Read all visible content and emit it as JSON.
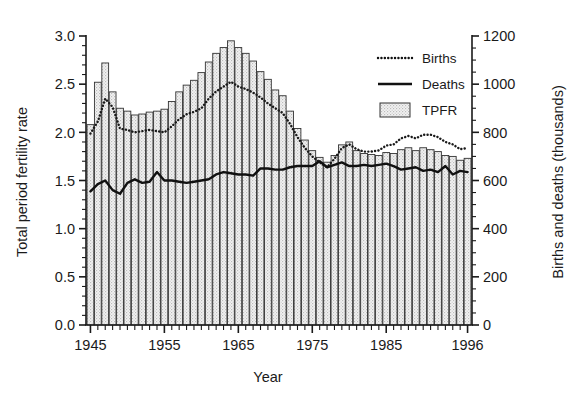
{
  "chart_data": {
    "type": "bar",
    "title": "",
    "subtitle": "",
    "xlabel": "Year",
    "ylabel": "Total period fertility rate",
    "y2label": "Births and deaths (thousands)",
    "xlim": [
      1944.4,
      1996.6
    ],
    "ylim": [
      0.0,
      3.0
    ],
    "y2lim": [
      0,
      1200
    ],
    "grid": false,
    "legend_position": "top-right",
    "x_ticks_major": [
      1945,
      1955,
      1965,
      1975,
      1985,
      1996
    ],
    "x_tick_labels": [
      "1945",
      "1955",
      "1965",
      "1975",
      "1985",
      "1996"
    ],
    "y_ticks_major": [
      0.0,
      0.5,
      1.0,
      1.5,
      2.0,
      2.5,
      3.0
    ],
    "y_tick_labels": [
      "0.0",
      "0.5",
      "1.0",
      "1.5",
      "2.0",
      "2.5",
      "3.0"
    ],
    "y2_ticks_major": [
      0,
      200,
      400,
      600,
      800,
      1000,
      1200
    ],
    "y2_tick_labels": [
      "0",
      "200",
      "400",
      "600",
      "800",
      "1000",
      "1200"
    ],
    "y_minor_step": 0.1,
    "y2_minor_step": 50,
    "x_minor_step": 1,
    "categories": [
      1945,
      1946,
      1947,
      1948,
      1949,
      1950,
      1951,
      1952,
      1953,
      1954,
      1955,
      1956,
      1957,
      1958,
      1959,
      1960,
      1961,
      1962,
      1963,
      1964,
      1965,
      1966,
      1967,
      1968,
      1969,
      1970,
      1971,
      1972,
      1973,
      1974,
      1975,
      1976,
      1977,
      1978,
      1979,
      1980,
      1981,
      1982,
      1983,
      1984,
      1985,
      1986,
      1987,
      1988,
      1989,
      1990,
      1991,
      1992,
      1993,
      1994,
      1995,
      1996
    ],
    "series": [
      {
        "name": "TPFR",
        "axis": "left",
        "style": "bar",
        "fill": "#e9e9e9",
        "edge": "#333333",
        "values": [
          2.08,
          2.52,
          2.72,
          2.42,
          2.25,
          2.22,
          2.18,
          2.19,
          2.21,
          2.22,
          2.24,
          2.32,
          2.42,
          2.49,
          2.54,
          2.62,
          2.73,
          2.82,
          2.88,
          2.95,
          2.88,
          2.82,
          2.74,
          2.63,
          2.55,
          2.44,
          2.38,
          2.22,
          2.04,
          1.92,
          1.81,
          1.74,
          1.69,
          1.76,
          1.87,
          1.9,
          1.81,
          1.78,
          1.77,
          1.76,
          1.79,
          1.78,
          1.82,
          1.84,
          1.81,
          1.84,
          1.82,
          1.8,
          1.76,
          1.75,
          1.71,
          1.73
        ]
      },
      {
        "name": "Births",
        "axis": "right",
        "style": "dotted-line",
        "color": "#1a1a1a",
        "values": [
          795,
          845,
          940,
          905,
          815,
          810,
          800,
          805,
          810,
          805,
          800,
          825,
          855,
          875,
          885,
          900,
          940,
          970,
          990,
          1010,
          990,
          980,
          965,
          945,
          920,
          900,
          880,
          835,
          780,
          735,
          700,
          675,
          655,
          690,
          735,
          750,
          730,
          720,
          720,
          725,
          745,
          750,
          775,
          785,
          775,
          790,
          790,
          780,
          760,
          750,
          730,
          735
        ]
      },
      {
        "name": "Deaths",
        "axis": "right",
        "style": "solid-line",
        "color": "#111111",
        "values": [
          555,
          585,
          600,
          560,
          545,
          590,
          605,
          590,
          595,
          635,
          600,
          600,
          595,
          590,
          595,
          600,
          605,
          625,
          635,
          630,
          625,
          625,
          620,
          650,
          650,
          645,
          645,
          655,
          660,
          660,
          660,
          680,
          655,
          665,
          675,
          660,
          660,
          665,
          660,
          665,
          670,
          660,
          645,
          650,
          655,
          640,
          645,
          635,
          660,
          625,
          640,
          635
        ]
      }
    ],
    "legend": [
      {
        "label": "Births",
        "marker": "dotted-line"
      },
      {
        "label": "Deaths",
        "marker": "solid-line"
      },
      {
        "label": "TPFR",
        "marker": "swatch"
      }
    ]
  },
  "colors": {
    "bar_fill": "#e9e9e9",
    "bar_edge": "#333333",
    "line": "#111111",
    "axis": "#1a1a1a",
    "background": "#ffffff"
  }
}
